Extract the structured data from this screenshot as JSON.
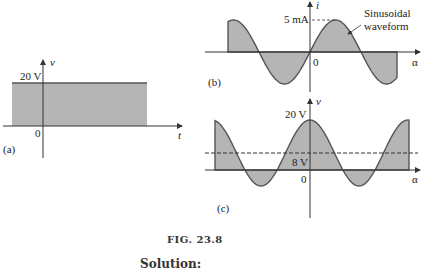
{
  "figure": {
    "caption": "FIG. 23.8",
    "following_heading": "Solution:",
    "panels": {
      "a": {
        "label": "(a)",
        "y_axis": "v",
        "x_axis": "t",
        "level_label": "20 V",
        "origin": "0"
      },
      "b": {
        "label": "(b)",
        "y_axis": "i",
        "x_axis": "α",
        "peak_label": "5 mA",
        "origin": "0",
        "annotation": "Sinusoidal",
        "annotation2": "waveform"
      },
      "c": {
        "label": "(c)",
        "y_axis": "v",
        "x_axis": "α",
        "peak_label": "20 V",
        "dc_label": "8 V",
        "origin": "0"
      }
    }
  },
  "colors": {
    "fill": "#b5b5b5",
    "line": "#555555"
  },
  "chart_data": [
    {
      "type": "area",
      "title": "(a) DC voltage",
      "xlabel": "t",
      "ylabel": "v",
      "series": [
        {
          "name": "v",
          "values": [
            20,
            20
          ]
        }
      ],
      "annotations": [
        "20 V",
        "0"
      ]
    },
    {
      "type": "line",
      "title": "(b) Sinusoidal waveform",
      "xlabel": "α",
      "ylabel": "i",
      "series": [
        {
          "name": "i = 5 sin α (mA)",
          "amplitude": 5,
          "unit": "mA"
        }
      ],
      "annotations": [
        "5 mA",
        "Sinusoidal waveform",
        "0"
      ]
    },
    {
      "type": "line",
      "title": "(c) Sinusoid with DC offset",
      "xlabel": "α",
      "ylabel": "v",
      "series": [
        {
          "name": "v",
          "peak": 20,
          "dc_level": 8,
          "unit": "V"
        }
      ],
      "annotations": [
        "20 V",
        "8 V",
        "0"
      ]
    }
  ]
}
